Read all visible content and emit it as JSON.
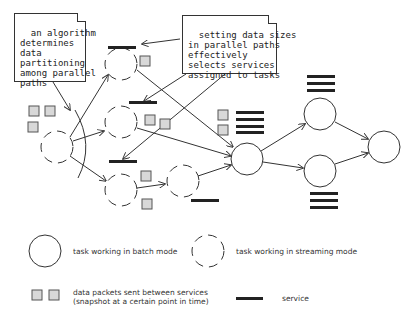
{
  "notes": {
    "left": "an algorithm\ndetermines\ndata\npartitioning\namong parallel\npaths",
    "right": "setting data sizes\nin parallel paths\neffectively\nselects services\nassigned to tasks"
  },
  "legend": {
    "batch": "task working in batch mode",
    "streaming": "task working in streaming mode",
    "packets": "data packets sent between services\n(snapshot at a certain point in time)",
    "service": "service"
  },
  "colors": {
    "stroke": "#333333",
    "packet_fill": "#d8d8d8",
    "service": "#222222"
  }
}
